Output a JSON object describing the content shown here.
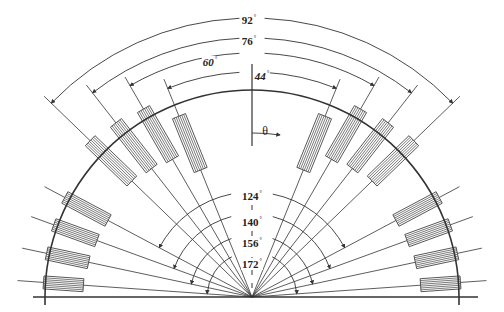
{
  "figure": {
    "type": "semicircular-array-schematic",
    "center": [
      252,
      297
    ],
    "radius": 207,
    "baseline_y": 297,
    "baseline_x": [
      33,
      478
    ],
    "theta_label": "θ",
    "degree_symbol": "°",
    "colors": {
      "line": "#333333",
      "element_fill": "#ffffff",
      "element_stroke": "#444444",
      "text": "#222222"
    }
  },
  "upper_groups": [
    {
      "full_angle": 44,
      "label": "44",
      "italic": true,
      "half_angle": 22,
      "arc_r": 225,
      "label_pos": [
        262,
        76
      ]
    },
    {
      "full_angle": 60,
      "label": "60",
      "italic": true,
      "half_angle": 30,
      "arc_r": 244,
      "label_pos": [
        210,
        62
      ]
    },
    {
      "full_angle": 76,
      "label": "76",
      "italic": false,
      "half_angle": 38,
      "arc_r": 259,
      "label_pos": [
        249,
        41
      ]
    },
    {
      "full_angle": 92,
      "label": "92",
      "italic": false,
      "half_angle": 46,
      "arc_r": 279,
      "label_pos": [
        249,
        20
      ]
    }
  ],
  "lower_groups": [
    {
      "full_angle": 124,
      "label": "124",
      "half_angle": 62,
      "arc_r": 105,
      "label_pos": [
        252,
        196
      ]
    },
    {
      "full_angle": 140,
      "label": "140",
      "half_angle": 70,
      "arc_r": 83,
      "label_pos": [
        252,
        222
      ]
    },
    {
      "full_angle": 156,
      "label": "156",
      "half_angle": 78,
      "arc_r": 62,
      "label_pos": [
        252,
        243
      ]
    },
    {
      "full_angle": 172,
      "label": "172",
      "half_angle": 86,
      "arc_r": 45,
      "label_pos": [
        252,
        264
      ]
    }
  ],
  "elements": {
    "inner_r": 150,
    "length": 58,
    "width": 14,
    "stripes": 7,
    "lower_inner_r": 158,
    "lower_length": 40,
    "lower_width": 13
  }
}
